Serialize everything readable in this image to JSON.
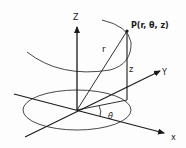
{
  "diagram": {
    "labels": {
      "z_axis": "Z",
      "y_axis": "Y",
      "x_axis": "x",
      "point": "P(r, θ, z)",
      "radius": "r",
      "height": "z",
      "angle": "θ"
    },
    "colors": {
      "stroke": "#1a1a1a",
      "background": "#fdfdfd"
    }
  }
}
